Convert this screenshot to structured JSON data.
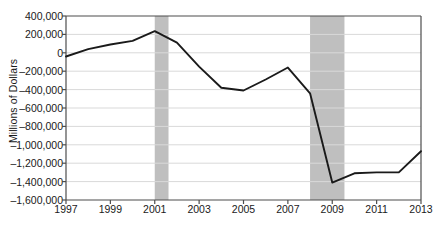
{
  "chart_data": {
    "type": "line",
    "title": "",
    "xlabel": "",
    "ylabel": "Millions of Dollars",
    "x": [
      1997,
      1998,
      1999,
      2000,
      2001,
      2002,
      2003,
      2004,
      2005,
      2006,
      2007,
      2008,
      2009,
      2010,
      2011,
      2012,
      2013
    ],
    "values": [
      -40000,
      40000,
      90000,
      130000,
      236000,
      110000,
      -150000,
      -380000,
      -410000,
      -290000,
      -160000,
      -440000,
      -1410000,
      -1310000,
      -1300000,
      -1300000,
      -1070000
    ],
    "series": [
      {
        "name": "Balance",
        "values": [
          -40000,
          40000,
          90000,
          130000,
          236000,
          110000,
          -150000,
          -380000,
          -410000,
          -290000,
          -160000,
          -440000,
          -1410000,
          -1310000,
          -1300000,
          -1300000,
          -1070000
        ],
        "color": "#1a1a1a"
      }
    ],
    "xlim": [
      1997,
      2013
    ],
    "ylim": [
      -1600000,
      400000
    ],
    "ytick_labels": [
      "400,000",
      "200,000",
      "0",
      "–200,000",
      "–400,000",
      "–600,000",
      "–800,000",
      "–1,000,000",
      "–1,200,000",
      "–1,400,000",
      "–1,600,000"
    ],
    "ytick_values": [
      400000,
      200000,
      0,
      -200000,
      -400000,
      -600000,
      -800000,
      -1000000,
      -1200000,
      -1400000,
      -1600000
    ],
    "xtick_labels": [
      "1997",
      "1999",
      "2001",
      "2003",
      "2005",
      "2007",
      "2009",
      "2011",
      "2013"
    ],
    "xtick_values": [
      1997,
      1999,
      2001,
      2003,
      2005,
      2007,
      2009,
      2011,
      2013
    ],
    "grid": true,
    "grid_color": "#d9d9d9",
    "legend": "none",
    "shaded_bands": [
      {
        "name": "recession-2001",
        "start": 2001.0,
        "end": 2001.62,
        "color": "#bfbfbf"
      },
      {
        "name": "recession-2008",
        "start": 2008.0,
        "end": 2009.55,
        "color": "#bfbfbf"
      }
    ],
    "axis_color": "#4d4d4d",
    "line_color": "#1a1a1a"
  }
}
